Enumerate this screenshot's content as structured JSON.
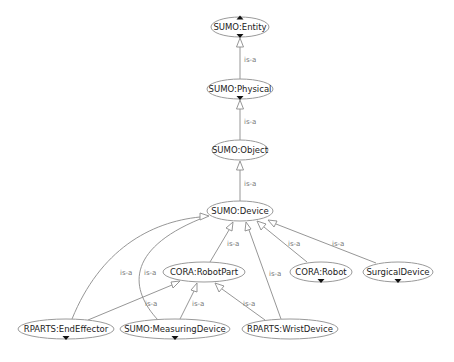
{
  "diagram": {
    "type": "ontology-hierarchy",
    "edge_label": "is-a",
    "nodes": [
      {
        "id": "entity",
        "label": "SUMO:Entity",
        "cx": 240,
        "cy": 27,
        "rx": 29,
        "ry": 10,
        "expand_up": true,
        "expand_down": true
      },
      {
        "id": "physical",
        "label": "SUMO:Physical",
        "cx": 240,
        "cy": 89,
        "rx": 33,
        "ry": 10,
        "expand_up": false,
        "expand_down": true
      },
      {
        "id": "object",
        "label": "SUMO:Object",
        "cx": 240,
        "cy": 150,
        "rx": 28,
        "ry": 10,
        "expand_up": false,
        "expand_down": false
      },
      {
        "id": "device",
        "label": "SUMO:Device",
        "cx": 240,
        "cy": 211,
        "rx": 33,
        "ry": 10,
        "expand_up": false,
        "expand_down": false
      },
      {
        "id": "robotpart",
        "label": "CORA:RobotPart",
        "cx": 204,
        "cy": 272,
        "rx": 41,
        "ry": 10,
        "expand_up": false,
        "expand_down": false
      },
      {
        "id": "robot",
        "label": "CORA:Robot",
        "cx": 321,
        "cy": 272,
        "rx": 31,
        "ry": 10,
        "expand_up": false,
        "expand_down": true
      },
      {
        "id": "surgical",
        "label": "SurgicalDevice",
        "cx": 398,
        "cy": 272,
        "rx": 35,
        "ry": 10,
        "expand_up": false,
        "expand_down": true
      },
      {
        "id": "endeffector",
        "label": "RPARTS:EndEffector",
        "cx": 66,
        "cy": 329,
        "rx": 48,
        "ry": 10,
        "expand_up": false,
        "expand_down": true
      },
      {
        "id": "measuring",
        "label": "SUMO:MeasuringDevice",
        "cx": 175,
        "cy": 329,
        "rx": 55,
        "ry": 10,
        "expand_up": false,
        "expand_down": true
      },
      {
        "id": "wrist",
        "label": "RPARTS:WristDevice",
        "cx": 290,
        "cy": 329,
        "rx": 48,
        "ry": 10,
        "expand_up": false,
        "expand_down": false
      }
    ],
    "edges": [
      {
        "from": "physical",
        "to": "entity",
        "label": "is-a"
      },
      {
        "from": "object",
        "to": "physical",
        "label": "is-a"
      },
      {
        "from": "device",
        "to": "object",
        "label": "is-a"
      },
      {
        "from": "robotpart",
        "to": "device",
        "label": "is-a"
      },
      {
        "from": "robot",
        "to": "device",
        "label": "is-a"
      },
      {
        "from": "surgical",
        "to": "device",
        "label": "is-a"
      },
      {
        "from": "endeffector",
        "to": "device",
        "label": "is-a"
      },
      {
        "from": "measuring",
        "to": "device",
        "label": "is-a"
      },
      {
        "from": "wrist",
        "to": "device",
        "label": "is-a"
      },
      {
        "from": "endeffector",
        "to": "robotpart",
        "label": "is-a"
      },
      {
        "from": "measuring",
        "to": "robotpart",
        "label": "is-a"
      },
      {
        "from": "wrist",
        "to": "robotpart",
        "label": "is-a"
      }
    ]
  }
}
